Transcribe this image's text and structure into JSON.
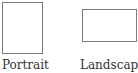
{
  "orientation": {
    "options": [
      {
        "id": "portrait",
        "label": "Portrait",
        "icon": "portrait-page-icon"
      },
      {
        "id": "landscape",
        "label": "Landscape",
        "icon": "landscape-page-icon"
      }
    ]
  },
  "colors": {
    "border": "#7a7a7a",
    "text": "#333333",
    "background": "#ffffff"
  }
}
